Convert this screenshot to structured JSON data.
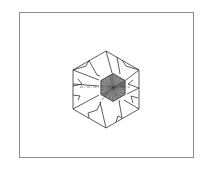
{
  "diagram": {
    "title": "",
    "type": "origami-fold-diagram",
    "shape": "hexagon",
    "outer_hexagon": {
      "cx": 106,
      "cy": 89.5,
      "radius": 38.5,
      "orientation": "pointy-top"
    },
    "inner_hexagon": {
      "cx": 113,
      "cy": 87.5,
      "radius": 14,
      "fill": "#7a7a7a",
      "hatch": "radial"
    },
    "fold_lines": "dash-dot mountain/valley lines through center",
    "colors": {
      "frame": "#8a8a8a",
      "stroke": "#333333",
      "shade": "#7a7a7a",
      "background": "#ffffff"
    }
  }
}
